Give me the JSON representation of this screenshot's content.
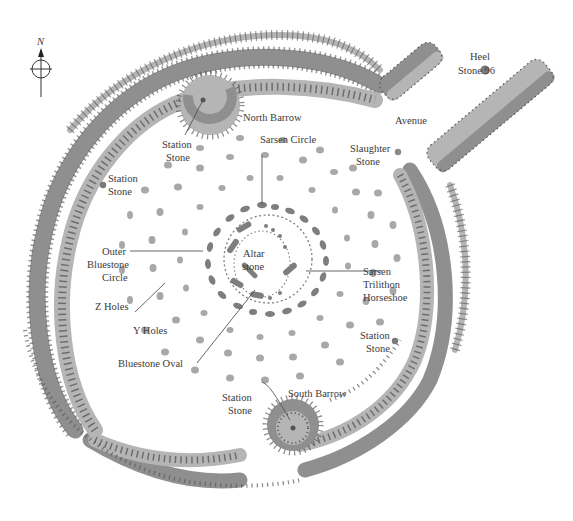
{
  "compass": {
    "label": "N",
    "icon": "north-arrow-compass"
  },
  "colors": {
    "bank_dark": "#8f8f8f",
    "bank_light": "#b5b5b5",
    "stone": "#8a8a8a",
    "hole": "#a8a8a8",
    "tick": "#555555",
    "text": "#3a3a3a",
    "leader": "#555555",
    "background": "#ffffff"
  },
  "labels": {
    "heel_stone": [
      "Heel",
      "Stone 96"
    ],
    "north_barrow": "North Barrow",
    "avenue": "Avenue",
    "station_stone_nw": [
      "Station",
      "Stone"
    ],
    "station_stone_w": [
      "Station",
      "Stone"
    ],
    "slaughter_stone": [
      "Slaughter",
      "Stone"
    ],
    "sarsen_circle": "Sarsen Circle",
    "outer_bluestone_circle": [
      "Outer",
      "Bluestone",
      "Circle"
    ],
    "altar_stone": [
      "Altar",
      "stone"
    ],
    "sarsen_trilithon_horseshoe": [
      "Sarsen",
      "Trilithon",
      "Horseshoe"
    ],
    "z_holes": "Z Holes",
    "y_holes": "Y Holes",
    "station_stone_e": [
      "Station",
      "Stone"
    ],
    "bluestone_oval": "Bluestone Oval",
    "station_stone_s": [
      "Station",
      "Stone"
    ],
    "south_barrow": "South Barrow"
  }
}
